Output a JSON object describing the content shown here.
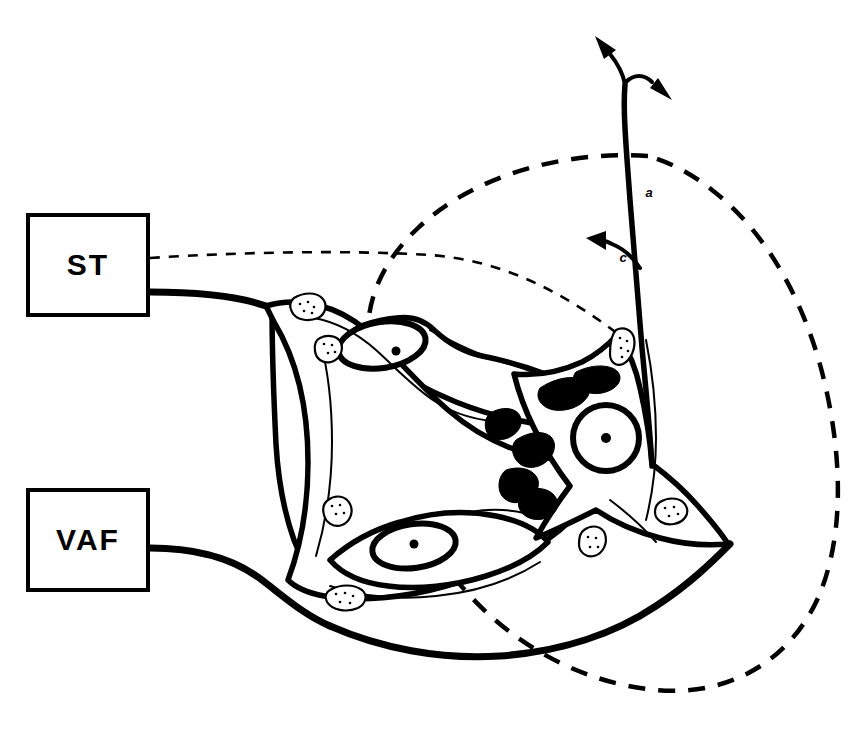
{
  "figure": {
    "type": "neuroanatomical-schematic",
    "background_color": "#ffffff",
    "ink_color": "#000000",
    "width": 866,
    "height": 732
  },
  "input_boxes": [
    {
      "id": "st",
      "label": "ST",
      "x": 28,
      "y": 215,
      "width": 120,
      "height": 100,
      "description": "solitary tract input box"
    },
    {
      "id": "vaf",
      "label": "VAF",
      "x": 28,
      "y": 490,
      "width": 120,
      "height": 100,
      "description": "ventral afferent fiber input box"
    }
  ],
  "axon_labels": [
    {
      "id": "a",
      "label": "a",
      "x": 649,
      "y": 194
    },
    {
      "id": "c",
      "label": "c",
      "x": 623,
      "y": 259
    }
  ],
  "legend_semantics": {
    "dashed_large_arc": "receptive field boundary",
    "dashed_thin_line": "solitary tract collateral to bouton",
    "solid_thick_fibers": "afferent fibers from ST and VAF",
    "axon_a": "axon",
    "collateral_c": "recurrent collateral",
    "filled_terminals": "axo-somatic synaptic terminals",
    "stippled_terminals": "axo-dendritic synaptic boutons"
  },
  "element_counts": {
    "neurons": 3,
    "nuclei": 3,
    "nucleoli": 3,
    "stippled_boutons": 7,
    "filled_terminals": 6,
    "arrowheads": 3
  }
}
